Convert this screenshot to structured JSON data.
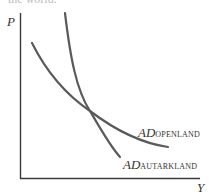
{
  "caption_fragment": "the world.",
  "axes": {
    "y_label": "P",
    "x_label": "Y"
  },
  "curves": [
    {
      "name": "AD",
      "subscript": "OPENLAND",
      "description": "flatter aggregate demand curve"
    },
    {
      "name": "AD",
      "subscript": "AUTARKLAND",
      "description": "steeper aggregate demand curve"
    }
  ],
  "colors": {
    "axis": "#3a3a3a",
    "curve": "#5a5a5a",
    "text": "#333333"
  }
}
